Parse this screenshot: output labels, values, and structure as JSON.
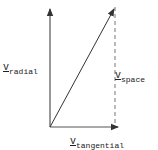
{
  "diagram": {
    "type": "vector-decomposition",
    "colors": {
      "line": "#333333",
      "text": "#222222",
      "background": "#ffffff"
    },
    "vectors": [
      {
        "name": "radial",
        "from": [
          50,
          127
        ],
        "to": [
          50,
          8
        ],
        "style": "solid-arrow"
      },
      {
        "name": "tangential",
        "from": [
          50,
          127
        ],
        "to": [
          118,
          127
        ],
        "style": "solid-arrow"
      },
      {
        "name": "space",
        "from": [
          50,
          127
        ],
        "to": [
          115,
          8
        ],
        "style": "solid-arrow"
      },
      {
        "name": "space-component-guide",
        "from": [
          115,
          125
        ],
        "to": [
          115,
          7
        ],
        "style": "dashed"
      }
    ],
    "labels": {
      "radial": {
        "symbol": "v",
        "subscript": "radial"
      },
      "space": {
        "symbol": "v",
        "subscript": "space"
      },
      "tangential": {
        "symbol": "v",
        "subscript": "tangential"
      }
    }
  }
}
